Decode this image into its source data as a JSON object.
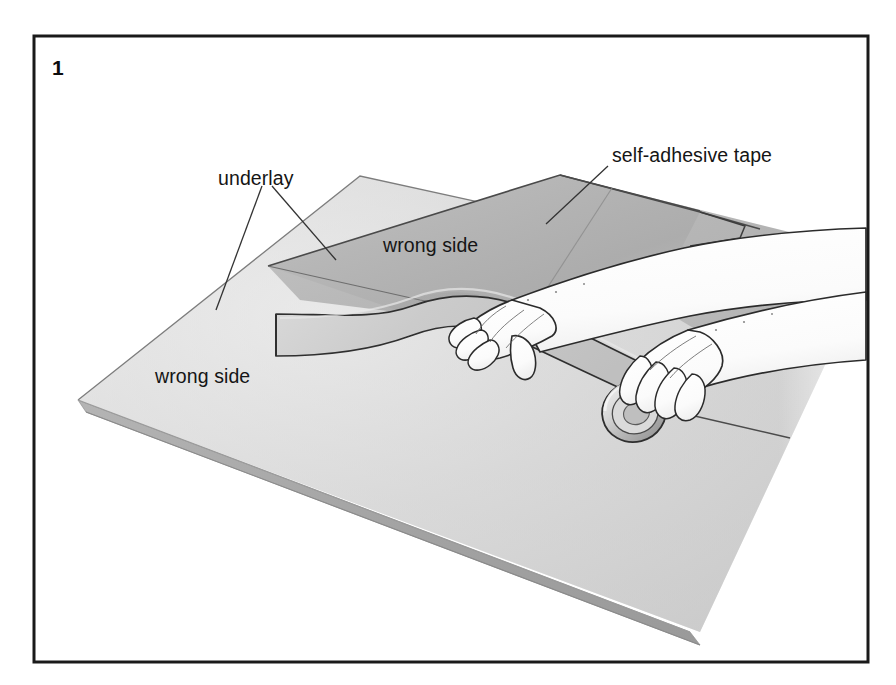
{
  "figure": {
    "number": "1",
    "caption_labels": {
      "underlay": "underlay",
      "tape": "self-adhesive tape",
      "wrong_side_upper": "wrong side",
      "wrong_side_lower": "wrong side"
    }
  },
  "colors": {
    "frame_stroke": "#1a1a1a",
    "background": "#ffffff",
    "carpet_lower_light": "#e3e3e3",
    "carpet_lower_dark": "#c8c8c8",
    "carpet_upper_light": "#c6c6c6",
    "carpet_upper_dark": "#a8a8a8",
    "tape_strip": "#cfcfcf",
    "hand_fill": "#fdfdfd",
    "outline": "#2b2b2b",
    "leader_line": "#333333",
    "text": "#151515"
  },
  "scene": {
    "description": "Joining two carpet pieces wrong side up with self-adhesive tape",
    "elements": [
      "lower carpet panel wrong side up",
      "upper carpet panel folded back wrong side up",
      "self-adhesive tape strip laid along the seam",
      "left hand pressing the tape down",
      "right hand holding the tape roll"
    ]
  }
}
